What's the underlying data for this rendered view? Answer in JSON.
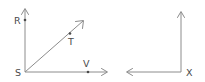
{
  "figure": {
    "background_color": "#ffffff",
    "line_color": "#8c8c8c",
    "label_color": "#4a4a4a",
    "diagrams": [
      {
        "name": "angle-RSV-with-ray-ST",
        "vertex": {
          "label": "S",
          "x": 25,
          "y": 72,
          "label_x": 15,
          "label_y": 76
        },
        "rays": [
          {
            "name": "ray-SR",
            "direction": "up",
            "from_x": 25,
            "from_y": 72,
            "to_x": 25,
            "to_y": 9,
            "endpoint_label": "R",
            "label_x": 14,
            "label_y": 24,
            "marked_point": {
              "label": "R",
              "x": 25,
              "y": 20
            }
          },
          {
            "name": "ray-ST",
            "direction": "diagonal-up-right",
            "from_x": 25,
            "from_y": 72,
            "to_x": 83,
            "to_y": 21,
            "endpoint_label": "T",
            "label_x": 68,
            "label_y": 45,
            "marked_point": {
              "label": "T",
              "x": 70,
              "y": 34
            }
          },
          {
            "name": "ray-SV",
            "direction": "right",
            "from_x": 25,
            "from_y": 72,
            "to_x": 107,
            "to_y": 72,
            "endpoint_label": "V",
            "label_x": 83,
            "label_y": 67,
            "marked_point": {
              "label": "V",
              "x": 88,
              "y": 72
            }
          }
        ]
      },
      {
        "name": "right-angle-at-X",
        "vertex": {
          "label": "X",
          "x": 181,
          "y": 72,
          "label_x": 186,
          "label_y": 76
        },
        "rays": [
          {
            "name": "ray-X-up",
            "direction": "up",
            "from_x": 181,
            "from_y": 72,
            "to_x": 181,
            "to_y": 12,
            "endpoint_label": "",
            "marked_point": null
          },
          {
            "name": "ray-X-left",
            "direction": "left",
            "from_x": 181,
            "from_y": 72,
            "to_x": 127,
            "to_y": 72,
            "endpoint_label": "",
            "marked_point": null
          }
        ]
      }
    ],
    "labels": {
      "R": "R",
      "S": "S",
      "T": "T",
      "V": "V",
      "X": "X"
    }
  }
}
